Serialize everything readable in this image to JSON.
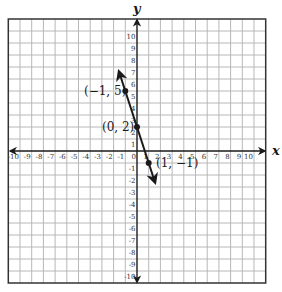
{
  "chart_data": {
    "type": "line",
    "title": "",
    "xlabel": "x",
    "ylabel": "y",
    "xlim": [
      -11,
      11
    ],
    "ylim": [
      -11,
      11
    ],
    "grid": true,
    "x_ticks": [
      -10,
      -9,
      -8,
      -7,
      -6,
      -5,
      -4,
      -3,
      -2,
      -1,
      0,
      1,
      2,
      3,
      4,
      5,
      6,
      7,
      8,
      9,
      10
    ],
    "y_ticks": [
      -10,
      -9,
      -8,
      -7,
      -6,
      -5,
      -4,
      -3,
      -2,
      -1,
      1,
      2,
      3,
      4,
      5,
      6,
      7,
      8,
      9,
      10
    ],
    "series": [
      {
        "name": "y = -3x + 2",
        "slope": -3,
        "intercept": 2,
        "line_extent": {
          "x_start": -1.55,
          "y_start": 6.65,
          "x_end": 1.55,
          "y_end": -2.65
        },
        "arrows": "both",
        "points": [
          {
            "x": -1,
            "y": 5,
            "label": "(−1, 5)"
          },
          {
            "x": 0,
            "y": 2,
            "label": "(0, 2)"
          },
          {
            "x": 1,
            "y": -1,
            "label": "(1, −1)"
          }
        ]
      }
    ]
  },
  "labels": {
    "x_axis": "x",
    "y_axis": "y",
    "point_a": "(−1, 5)",
    "point_b": "(0, 2)",
    "point_c": "(1, −1)"
  },
  "colors": {
    "grid": "#b8b8b8",
    "border": "#333333",
    "axis": "#1a1a1a",
    "line": "#1a1a1a"
  }
}
